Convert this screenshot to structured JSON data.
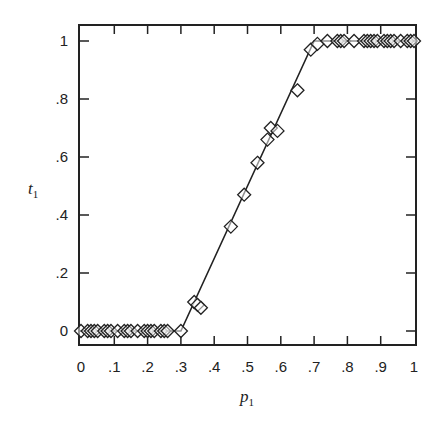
{
  "chart_data": {
    "type": "scatter",
    "title": "",
    "xlabel": "p1",
    "ylabel": "t1",
    "xlim": [
      0,
      1
    ],
    "ylim": [
      0,
      1
    ],
    "grid": false,
    "legend": null,
    "x_ticks": [
      "0",
      ".1",
      ".2",
      ".3",
      ".4",
      ".5",
      ".6",
      ".7",
      ".8",
      ".9",
      "1"
    ],
    "y_ticks": [
      "0",
      ".2",
      ".4",
      ".6",
      ".8",
      "1"
    ],
    "marker": "open-diamond",
    "line": {
      "type": "piecewise-linear",
      "points": [
        [
          0,
          0
        ],
        [
          0.3,
          0
        ],
        [
          0.7,
          1
        ],
        [
          1,
          1
        ]
      ]
    },
    "series": [
      {
        "name": "data",
        "points": [
          [
            0.0,
            0
          ],
          [
            0.02,
            0
          ],
          [
            0.03,
            0
          ],
          [
            0.04,
            0
          ],
          [
            0.05,
            0
          ],
          [
            0.07,
            0
          ],
          [
            0.08,
            0
          ],
          [
            0.09,
            0
          ],
          [
            0.11,
            0
          ],
          [
            0.13,
            0
          ],
          [
            0.14,
            0
          ],
          [
            0.15,
            0
          ],
          [
            0.17,
            0
          ],
          [
            0.19,
            0
          ],
          [
            0.2,
            0
          ],
          [
            0.21,
            0
          ],
          [
            0.22,
            0
          ],
          [
            0.24,
            0
          ],
          [
            0.25,
            0
          ],
          [
            0.26,
            0
          ],
          [
            0.3,
            0
          ],
          [
            0.34,
            0.1
          ],
          [
            0.35,
            0.09
          ],
          [
            0.36,
            0.08
          ],
          [
            0.45,
            0.36
          ],
          [
            0.49,
            0.47
          ],
          [
            0.53,
            0.58
          ],
          [
            0.56,
            0.66
          ],
          [
            0.57,
            0.7
          ],
          [
            0.59,
            0.69
          ],
          [
            0.65,
            0.83
          ],
          [
            0.69,
            0.97
          ],
          [
            0.71,
            0.99
          ],
          [
            0.74,
            1
          ],
          [
            0.77,
            1
          ],
          [
            0.78,
            1
          ],
          [
            0.79,
            1
          ],
          [
            0.82,
            1
          ],
          [
            0.85,
            1
          ],
          [
            0.86,
            1
          ],
          [
            0.87,
            1
          ],
          [
            0.88,
            1
          ],
          [
            0.89,
            1
          ],
          [
            0.91,
            1
          ],
          [
            0.92,
            1
          ],
          [
            0.93,
            1
          ],
          [
            0.94,
            1
          ],
          [
            0.96,
            1
          ],
          [
            0.98,
            1
          ],
          [
            0.99,
            1
          ],
          [
            1.0,
            1
          ]
        ]
      }
    ]
  },
  "labels": {
    "x_axis_main": "p",
    "x_axis_sub": "1",
    "y_axis_main": "t",
    "y_axis_sub": "1"
  },
  "style": {
    "line_color": "#222222",
    "marker_color": "#222222",
    "background": "#ffffff"
  }
}
